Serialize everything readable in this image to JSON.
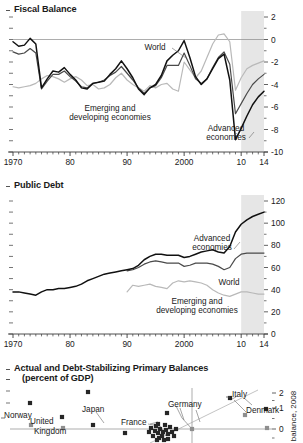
{
  "colors": {
    "advanced": "#111111",
    "world": "#4a4a4a",
    "emerging": "#b9b9b9",
    "forecast_shade": "#e6e6e6",
    "axis": "#3a3a3a",
    "zero_line": "#8a8a8a",
    "marker_dark": "#262626",
    "marker_grey": "#8e8e8e"
  },
  "panel1": {
    "title": "Fiscal Balance",
    "y_ticks": [
      "2",
      "0",
      "-2",
      "-4",
      "-6",
      "-8",
      "-10"
    ],
    "x_ticks": [
      "1970",
      "80",
      "90",
      "2000",
      "10",
      "14"
    ],
    "labels": {
      "world": "World",
      "emerging_line1": "Emerging and",
      "emerging_line2": "developing economies",
      "advanced_line1": "Advanced",
      "advanced_line2": "economies"
    }
  },
  "panel2": {
    "title": "Public Debt",
    "y_ticks": [
      "120",
      "100",
      "80",
      "60",
      "40",
      "20",
      "0"
    ],
    "x_ticks": [
      "1970",
      "80",
      "90",
      "2000",
      "10",
      "14"
    ],
    "labels": {
      "advanced_line1": "Advanced",
      "advanced_line2": "economies",
      "world": "World",
      "emerging_line1": "Emerging and",
      "emerging_line2": "developing economies"
    }
  },
  "panel3": {
    "title_line1": "Actual and Debt-Stabilizing Primary Balances",
    "title_line2": "(percent of GDP)",
    "y_ticks": [
      "2",
      "1",
      "0"
    ],
    "y_axis_label": "balance, 2008",
    "country_labels": [
      {
        "name": "Norway",
        "x": 4,
        "y": 415
      },
      {
        "name": "United",
        "x": 30,
        "y": 421
      },
      {
        "name": "Kingdom",
        "x": 34,
        "y": 431
      },
      {
        "name": "Japan",
        "x": 82,
        "y": 409
      },
      {
        "name": "France",
        "x": 121,
        "y": 422
      },
      {
        "name": "Germany",
        "x": 168,
        "y": 404
      },
      {
        "name": "Italy",
        "x": 232,
        "y": 394
      },
      {
        "name": "Denmark",
        "x": 246,
        "y": 410
      }
    ]
  },
  "chart_data": [
    {
      "type": "line",
      "title": "Fiscal Balance",
      "xlabel": "",
      "ylabel": "percent of GDP",
      "xlim": [
        1970,
        2014
      ],
      "ylim": [
        -10,
        2
      ],
      "x_tick_values": [
        1970,
        1980,
        1990,
        2000,
        2010,
        2014
      ],
      "x_tick_labels": [
        "1970",
        "80",
        "90",
        "2000",
        "10",
        "14"
      ],
      "y_tick_values": [
        2,
        0,
        -2,
        -4,
        -6,
        -8,
        -10
      ],
      "grid": false,
      "legend": "inline-annotations",
      "forecast_start": 2010,
      "series": [
        {
          "name": "Advanced economies",
          "color": "#111111",
          "x": [
            1970,
            1971,
            1972,
            1973,
            1974,
            1975,
            1976,
            1977,
            1978,
            1979,
            1980,
            1981,
            1982,
            1983,
            1984,
            1985,
            1986,
            1987,
            1988,
            1989,
            1990,
            1991,
            1992,
            1993,
            1994,
            1995,
            1996,
            1997,
            1998,
            1999,
            2000,
            2001,
            2002,
            2003,
            2004,
            2005,
            2006,
            2007,
            2008,
            2009,
            2010,
            2011,
            2012,
            2013,
            2014
          ],
          "values": [
            -0.2,
            -0.6,
            -0.5,
            0.1,
            -0.4,
            -4.3,
            -3.5,
            -2.8,
            -2.9,
            -2.5,
            -3.1,
            -3.6,
            -4.3,
            -4.4,
            -3.9,
            -3.8,
            -3.7,
            -3.1,
            -2.6,
            -1.9,
            -2.6,
            -3.4,
            -4.4,
            -4.9,
            -4.3,
            -4.0,
            -3.2,
            -1.9,
            -1.4,
            -1.0,
            -0.1,
            -1.6,
            -3.3,
            -4.0,
            -3.5,
            -2.6,
            -1.7,
            -1.3,
            -3.6,
            -8.9,
            -7.9,
            -6.8,
            -5.8,
            -5.1,
            -4.6
          ]
        },
        {
          "name": "World",
          "color": "#4a4a4a",
          "x": [
            1970,
            1971,
            1972,
            1973,
            1974,
            1975,
            1976,
            1977,
            1978,
            1979,
            1980,
            1981,
            1982,
            1983,
            1984,
            1985,
            1986,
            1987,
            1988,
            1989,
            1990,
            1991,
            1992,
            1993,
            1994,
            1995,
            1996,
            1997,
            1998,
            1999,
            2000,
            2001,
            2002,
            2003,
            2004,
            2005,
            2006,
            2007,
            2008,
            2009,
            2010,
            2011,
            2012,
            2013,
            2014
          ],
          "values": [
            -1.1,
            -1.3,
            -1.2,
            -0.8,
            -1.2,
            -4.4,
            -3.7,
            -3.1,
            -3.1,
            -2.8,
            -3.3,
            -3.7,
            -4.2,
            -4.3,
            -3.9,
            -3.8,
            -3.6,
            -3.2,
            -2.9,
            -2.4,
            -3.0,
            -3.6,
            -4.3,
            -4.8,
            -4.3,
            -4.1,
            -3.4,
            -2.3,
            -2.3,
            -2.3,
            -1.2,
            -2.3,
            -3.5,
            -3.9,
            -3.5,
            -2.5,
            -1.6,
            -1.1,
            -2.2,
            -6.6,
            -5.7,
            -4.8,
            -4.0,
            -3.5,
            -3.1
          ]
        },
        {
          "name": "Emerging and developing economies",
          "color": "#b9b9b9",
          "x": [
            1970,
            1971,
            1972,
            1973,
            1974,
            1975,
            1976,
            1977,
            1978,
            1979,
            1980,
            1981,
            1982,
            1983,
            1984,
            1985,
            1986,
            1987,
            1988,
            1989,
            1990,
            1991,
            1992,
            1993,
            1994,
            1995,
            1996,
            1997,
            1998,
            1999,
            2000,
            2001,
            2002,
            2003,
            2004,
            2005,
            2006,
            2007,
            2008,
            2009,
            2010,
            2011,
            2012,
            2013,
            2014
          ],
          "values": [
            -4.2,
            -4.3,
            -4.2,
            -4.1,
            -3.9,
            -3.5,
            -3.2,
            -3.3,
            -3.5,
            -3.8,
            -3.5,
            -3.3,
            -3.6,
            -4.1,
            -4.0,
            -4.4,
            -4.3,
            -4.0,
            -3.4,
            -3.0,
            -3.6,
            -4.0,
            -4.3,
            -4.6,
            -4.1,
            -4.3,
            -4.0,
            -3.9,
            -4.4,
            -4.6,
            -2.0,
            -2.7,
            -3.4,
            -2.8,
            -1.6,
            -0.4,
            0.4,
            0.5,
            -0.2,
            -4.5,
            -3.4,
            -2.6,
            -2.3,
            -2.1,
            -1.9
          ]
        }
      ]
    },
    {
      "type": "line",
      "title": "Public Debt",
      "xlabel": "",
      "ylabel": "percent of GDP",
      "xlim": [
        1970,
        2014
      ],
      "ylim": [
        0,
        120
      ],
      "x_tick_values": [
        1970,
        1980,
        1990,
        2000,
        2010,
        2014
      ],
      "x_tick_labels": [
        "1970",
        "80",
        "90",
        "2000",
        "10",
        "14"
      ],
      "y_tick_values": [
        0,
        20,
        40,
        60,
        80,
        100,
        120
      ],
      "grid": false,
      "legend": "inline-annotations",
      "forecast_start": 2010,
      "series": [
        {
          "name": "Advanced economies",
          "color": "#111111",
          "x": [
            1970,
            1971,
            1972,
            1973,
            1974,
            1975,
            1976,
            1977,
            1978,
            1979,
            1980,
            1981,
            1982,
            1983,
            1984,
            1985,
            1986,
            1987,
            1988,
            1989,
            1990,
            1991,
            1992,
            1993,
            1994,
            1995,
            1996,
            1997,
            1998,
            1999,
            2000,
            2001,
            2002,
            2003,
            2004,
            2005,
            2006,
            2007,
            2008,
            2009,
            2010,
            2011,
            2012,
            2013,
            2014
          ],
          "values": [
            38,
            38,
            37,
            36,
            35,
            38,
            40,
            40,
            41,
            41,
            42,
            43,
            45,
            48,
            50,
            52,
            54,
            55,
            56,
            57,
            58,
            59,
            62,
            67,
            70,
            72,
            72,
            71,
            71,
            71,
            69,
            70,
            72,
            74,
            75,
            76,
            74,
            73,
            79,
            92,
            99,
            103,
            106,
            108,
            110
          ]
        },
        {
          "name": "World",
          "color": "#4a4a4a",
          "x": [
            1990,
            1991,
            1992,
            1993,
            1994,
            1995,
            1996,
            1997,
            1998,
            1999,
            2000,
            2001,
            2002,
            2003,
            2004,
            2005,
            2006,
            2007,
            2008,
            2009,
            2010,
            2011,
            2012,
            2013,
            2014
          ],
          "values": [
            57,
            58,
            60,
            63,
            65,
            66,
            65,
            64,
            64,
            64,
            61,
            62,
            64,
            64,
            64,
            63,
            61,
            58,
            60,
            68,
            72,
            73,
            73,
            73,
            73
          ]
        },
        {
          "name": "Emerging and developing economies",
          "color": "#b9b9b9",
          "x": [
            1990,
            1991,
            1992,
            1993,
            1994,
            1995,
            1996,
            1997,
            1998,
            1999,
            2000,
            2001,
            2002,
            2003,
            2004,
            2005,
            2006,
            2007,
            2008,
            2009,
            2010,
            2011,
            2012,
            2013,
            2014
          ],
          "values": [
            38,
            44,
            43,
            44,
            45,
            43,
            42,
            41,
            46,
            48,
            47,
            48,
            47,
            46,
            44,
            40,
            37,
            35,
            34,
            36,
            38,
            38,
            37,
            36,
            36
          ]
        }
      ]
    },
    {
      "type": "scatter",
      "title": "Actual and Debt-Stabilizing Primary Balances (percent of GDP)",
      "ylabel": "balance, 2008",
      "y_tick_values": [
        2,
        1,
        0
      ],
      "grid": false,
      "note": "partially cropped at bottom of screenshot",
      "points": [
        {
          "label": "Norway",
          "x": 30,
          "y": 403,
          "kind": "dark"
        },
        {
          "label": "Norway",
          "x": 31,
          "y": 425,
          "kind": "grey"
        },
        {
          "label": "United Kingdom",
          "x": 62,
          "y": 417,
          "kind": "dark"
        },
        {
          "label": "United Kingdom",
          "x": 63,
          "y": 428,
          "kind": "grey"
        },
        {
          "label": "Japan",
          "x": 88,
          "y": 392,
          "kind": "dark"
        },
        {
          "label": "Japan",
          "x": 93,
          "y": 425,
          "kind": "dark"
        },
        {
          "label": "",
          "x": 125,
          "y": 433,
          "kind": "dark"
        },
        {
          "label": "France",
          "x": 158,
          "y": 424,
          "kind": "dark"
        },
        {
          "label": "Germany",
          "x": 167,
          "y": 413,
          "kind": "dark"
        },
        {
          "label": "Germany",
          "x": 192,
          "y": 429,
          "kind": "grey"
        },
        {
          "label": "Italy",
          "x": 230,
          "y": 398,
          "kind": "dark"
        },
        {
          "label": "Italy",
          "x": 245,
          "y": 415,
          "kind": "grey"
        },
        {
          "label": "Denmark",
          "x": 266,
          "y": 409,
          "kind": "dark"
        },
        {
          "label": "Denmark",
          "x": 267,
          "y": 428,
          "kind": "grey"
        }
      ]
    }
  ]
}
